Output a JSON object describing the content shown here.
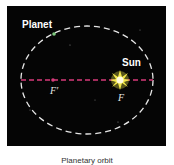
{
  "diagram": {
    "type": "orbit-ellipse",
    "labels": {
      "planet": "Planet",
      "sun": "Sun",
      "focus_empty": "F′",
      "focus_sun": "F"
    },
    "caption": "Planetary orbit",
    "colors": {
      "background": "#050505",
      "ellipse": "#e6e6e6",
      "major_axis": "#d63a7a",
      "sun_glow": "#f2e84a",
      "planet": "#7fc97f",
      "page": "#ffffff"
    }
  }
}
